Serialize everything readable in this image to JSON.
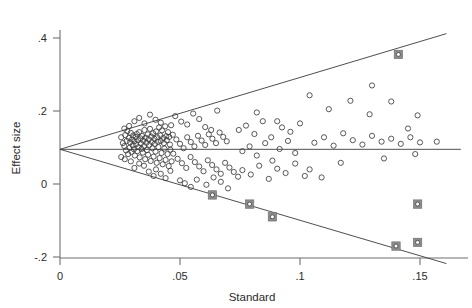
{
  "figure": {
    "title": "",
    "background": "#ffffff"
  },
  "axes": {
    "x_title": "Standard",
    "y_title": "Effect size",
    "x_ticks": [
      "0",
      ".05",
      ".1",
      ".15"
    ],
    "y_ticks": [
      ".4",
      ".2",
      "0",
      "-.2"
    ]
  },
  "chart_data": {
    "type": "scatter",
    "title": "",
    "xlabel": "Standard",
    "ylabel": "Effect size",
    "xlim": [
      0,
      0.167
    ],
    "ylim": [
      -0.22,
      0.44
    ],
    "xticks": [
      0,
      0.05,
      0.1,
      0.15
    ],
    "xticklabels": [
      "0",
      ".05",
      ".1",
      ".15"
    ],
    "yticks": [
      0.4,
      0.2,
      0,
      -0.2
    ],
    "yticklabels": [
      ".4",
      ".2",
      "0",
      "-.2"
    ],
    "grid": false,
    "legend": "none",
    "annotations": [
      {
        "text": "funnel plot with pseudo 95% confidence limits",
        "visible": false
      }
    ],
    "reference_lines": [
      {
        "name": "pooled-effect",
        "type": "horizontal",
        "y": 0.095,
        "x_from": 0.0,
        "x_to": 0.167
      },
      {
        "name": "upper-funnel-limit",
        "type": "line",
        "x_from": 0.0,
        "y_from": 0.095,
        "x_to": 0.161,
        "y_to": 0.412
      },
      {
        "name": "lower-funnel-limit",
        "type": "line",
        "x_from": 0.0,
        "y_from": 0.095,
        "x_to": 0.161,
        "y_to": -0.218
      }
    ],
    "series": [
      {
        "name": "studies",
        "marker": "open-circle",
        "color": "#3c3c3c",
        "points": [
          [
            0.0255,
            0.128
          ],
          [
            0.0262,
            0.112
          ],
          [
            0.0268,
            0.104
          ],
          [
            0.0272,
            0.134
          ],
          [
            0.0275,
            0.092
          ],
          [
            0.0278,
            0.118
          ],
          [
            0.0281,
            0.145
          ],
          [
            0.0284,
            0.082
          ],
          [
            0.0287,
            0.126
          ],
          [
            0.029,
            0.099
          ],
          [
            0.0292,
            0.114
          ],
          [
            0.0295,
            0.14
          ],
          [
            0.0298,
            0.088
          ],
          [
            0.03,
            0.122
          ],
          [
            0.0303,
            0.106
          ],
          [
            0.0305,
            0.133
          ],
          [
            0.0308,
            0.095
          ],
          [
            0.031,
            0.117
          ],
          [
            0.0312,
            0.078
          ],
          [
            0.0315,
            0.129
          ],
          [
            0.0317,
            0.109
          ],
          [
            0.032,
            0.137
          ],
          [
            0.0322,
            0.09
          ],
          [
            0.0325,
            0.12
          ],
          [
            0.0327,
            0.101
          ],
          [
            0.033,
            0.142
          ],
          [
            0.0332,
            0.073
          ],
          [
            0.0335,
            0.125
          ],
          [
            0.0337,
            0.111
          ],
          [
            0.034,
            0.096
          ],
          [
            0.0342,
            0.132
          ],
          [
            0.0345,
            0.086
          ],
          [
            0.0347,
            0.119
          ],
          [
            0.035,
            0.104
          ],
          [
            0.0352,
            0.148
          ],
          [
            0.0355,
            0.068
          ],
          [
            0.0357,
            0.127
          ],
          [
            0.036,
            0.113
          ],
          [
            0.0362,
            0.093
          ],
          [
            0.0365,
            0.136
          ],
          [
            0.0367,
            0.08
          ],
          [
            0.037,
            0.122
          ],
          [
            0.0372,
            0.107
          ],
          [
            0.0375,
            0.151
          ],
          [
            0.0378,
            0.063
          ],
          [
            0.038,
            0.13
          ],
          [
            0.0383,
            0.115
          ],
          [
            0.0385,
            0.098
          ],
          [
            0.0388,
            0.139
          ],
          [
            0.039,
            0.075
          ],
          [
            0.0393,
            0.124
          ],
          [
            0.0395,
            0.11
          ],
          [
            0.0398,
            0.089
          ],
          [
            0.04,
            0.144
          ],
          [
            0.0403,
            0.058
          ],
          [
            0.0405,
            0.128
          ],
          [
            0.0408,
            0.116
          ],
          [
            0.041,
            0.101
          ],
          [
            0.0413,
            0.155
          ],
          [
            0.0415,
            0.071
          ],
          [
            0.0418,
            0.133
          ],
          [
            0.042,
            0.118
          ],
          [
            0.0423,
            0.085
          ],
          [
            0.0425,
            0.147
          ],
          [
            0.0428,
            0.054
          ],
          [
            0.043,
            0.126
          ],
          [
            0.0433,
            0.112
          ],
          [
            0.0435,
            0.097
          ],
          [
            0.0438,
            0.158
          ],
          [
            0.044,
            0.066
          ],
          [
            0.0443,
            0.131
          ],
          [
            0.0445,
            0.12
          ],
          [
            0.0448,
            0.082
          ],
          [
            0.045,
            0.142
          ],
          [
            0.0453,
            0.049
          ],
          [
            0.0455,
            0.129
          ],
          [
            0.0458,
            0.108
          ],
          [
            0.046,
            0.094
          ],
          [
            0.0463,
            0.161
          ],
          [
            0.0465,
            0.062
          ],
          [
            0.031,
            0.172
          ],
          [
            0.033,
            0.181
          ],
          [
            0.0352,
            0.166
          ],
          [
            0.0375,
            0.19
          ],
          [
            0.0398,
            0.176
          ],
          [
            0.042,
            0.168
          ],
          [
            0.0288,
            0.159
          ],
          [
            0.0268,
            0.152
          ],
          [
            0.048,
            0.186
          ],
          [
            0.0505,
            0.171
          ],
          [
            0.053,
            0.163
          ],
          [
            0.0555,
            0.193
          ],
          [
            0.058,
            0.178
          ],
          [
            0.0605,
            0.156
          ],
          [
            0.063,
            0.148
          ],
          [
            0.0655,
            0.201
          ],
          [
            0.047,
            0.135
          ],
          [
            0.0485,
            0.122
          ],
          [
            0.05,
            0.11
          ],
          [
            0.0515,
            0.098
          ],
          [
            0.053,
            0.128
          ],
          [
            0.0545,
            0.115
          ],
          [
            0.056,
            0.103
          ],
          [
            0.0575,
            0.132
          ],
          [
            0.059,
            0.119
          ],
          [
            0.0605,
            0.107
          ],
          [
            0.062,
            0.136
          ],
          [
            0.0635,
            0.124
          ],
          [
            0.065,
            0.112
          ],
          [
            0.0665,
            0.141
          ],
          [
            0.068,
            0.129
          ],
          [
            0.0695,
            0.117
          ],
          [
            0.0472,
            0.083
          ],
          [
            0.049,
            0.069
          ],
          [
            0.0508,
            0.057
          ],
          [
            0.0526,
            0.044
          ],
          [
            0.0544,
            0.074
          ],
          [
            0.0562,
            0.06
          ],
          [
            0.058,
            0.048
          ],
          [
            0.0598,
            0.035
          ],
          [
            0.0616,
            0.065
          ],
          [
            0.0634,
            0.052
          ],
          [
            0.0652,
            0.04
          ],
          [
            0.067,
            0.028
          ],
          [
            0.0688,
            0.058
          ],
          [
            0.0706,
            0.045
          ],
          [
            0.0724,
            0.033
          ],
          [
            0.0742,
            0.02
          ],
          [
            0.04,
            0.04
          ],
          [
            0.042,
            0.028
          ],
          [
            0.044,
            0.016
          ],
          [
            0.046,
            0.036
          ],
          [
            0.035,
            0.05
          ],
          [
            0.037,
            0.034
          ],
          [
            0.039,
            0.022
          ],
          [
            0.033,
            0.056
          ],
          [
            0.0295,
            0.062
          ],
          [
            0.031,
            0.044
          ],
          [
            0.027,
            0.068
          ],
          [
            0.0255,
            0.074
          ],
          [
            0.05,
            0.01
          ],
          [
            0.052,
            0.002
          ],
          [
            0.0545,
            -0.008
          ],
          [
            0.057,
            0.012
          ],
          [
            0.061,
            -0.002
          ],
          [
            0.064,
            0.018
          ],
          [
            0.067,
            0.006
          ],
          [
            0.07,
            -0.012
          ],
          [
            0.076,
            0.09
          ],
          [
            0.079,
            0.103
          ],
          [
            0.082,
            0.078
          ],
          [
            0.0855,
            0.112
          ],
          [
            0.0885,
            0.064
          ],
          [
            0.0915,
            0.096
          ],
          [
            0.095,
            0.118
          ],
          [
            0.098,
            0.085
          ],
          [
            0.0745,
            0.148
          ],
          [
            0.0775,
            0.16
          ],
          [
            0.081,
            0.137
          ],
          [
            0.0845,
            0.172
          ],
          [
            0.088,
            0.128
          ],
          [
            0.0925,
            0.155
          ],
          [
            0.096,
            0.143
          ],
          [
            0.1,
            0.166
          ],
          [
            0.076,
            0.038
          ],
          [
            0.0795,
            0.026
          ],
          [
            0.083,
            0.05
          ],
          [
            0.087,
            0.014
          ],
          [
            0.0905,
            0.042
          ],
          [
            0.094,
            0.03
          ],
          [
            0.098,
            0.056
          ],
          [
            0.102,
            0.022
          ],
          [
            0.106,
            0.113
          ],
          [
            0.11,
            0.128
          ],
          [
            0.114,
            0.105
          ],
          [
            0.118,
            0.139
          ],
          [
            0.122,
            0.12
          ],
          [
            0.126,
            0.108
          ],
          [
            0.13,
            0.132
          ],
          [
            0.134,
            0.116
          ],
          [
            0.138,
            0.124
          ],
          [
            0.142,
            0.11
          ],
          [
            0.146,
            0.128
          ],
          [
            0.15,
            0.114
          ],
          [
            0.138,
            0.226
          ],
          [
            0.129,
            0.191
          ],
          [
            0.121,
            0.228
          ],
          [
            0.112,
            0.205
          ],
          [
            0.104,
            0.243
          ],
          [
            0.149,
            0.188
          ],
          [
            0.145,
            0.152
          ],
          [
            0.157,
            0.116
          ],
          [
            0.13,
            0.27
          ],
          [
            0.117,
            0.058
          ],
          [
            0.135,
            0.07
          ],
          [
            0.148,
            0.082
          ],
          [
            0.104,
            0.04
          ],
          [
            0.109,
            0.018
          ],
          [
            0.0905,
            0.172
          ],
          [
            0.082,
            0.196
          ]
        ]
      },
      {
        "name": "trimmed-imputed-studies",
        "marker": "circle-in-filled-square",
        "color": "#8c8c8c",
        "points": [
          [
            0.0635,
            -0.03
          ],
          [
            0.079,
            -0.055
          ],
          [
            0.0885,
            -0.09
          ],
          [
            0.14,
            -0.17
          ],
          [
            0.149,
            -0.16
          ],
          [
            0.149,
            -0.055
          ],
          [
            0.141,
            0.355
          ]
        ]
      }
    ]
  }
}
